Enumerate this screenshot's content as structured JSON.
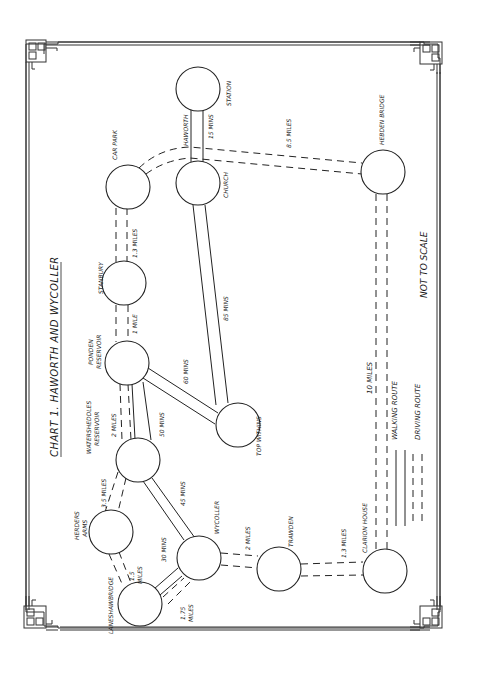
{
  "title": "CHART 1.  HAWORTH AND WYCOLLER",
  "note": "NOT TO SCALE",
  "legend": {
    "walking": "WALKING ROUTE",
    "driving": "DRIVING ROUTE"
  },
  "nodes": {
    "haworth_station": "STATION",
    "haworth": "HAWORTH",
    "church": "CHURCH",
    "car_park": "CAR PARK",
    "stanbury": "STANBURY",
    "ponden_1": "PONDEN",
    "ponden_2": "RESERVOIR",
    "watersheddles_1": "WATERSHEDDLES",
    "watersheddles_2": "RESERVOIR",
    "herders_1": "HERDERS",
    "herders_2": "ARMS",
    "laneshawbridge": "LANESHAWBRIDGE",
    "wycoller": "WYCOLLER",
    "top_withins": "TOP WITHINS",
    "trawden": "TRAWDEN",
    "clarion_house": "CLARION HOUSE",
    "hebden_bridge": "HEBDEN BRIDGE"
  },
  "edges": {
    "station_church": "15 MINS",
    "church_hebden": "8.5 MILES",
    "carpark_stanbury": "1.3 MILES",
    "stanbury_ponden": "1 MILE",
    "church_topwithins": "85 MINS",
    "ponden_topwithins": "60 MINS",
    "ponden_watersheddles_walk": "2 MILES",
    "ponden_watersheddles_drive": "50 MINS",
    "watersheddles_herders": "3.5 MILES",
    "watersheddles_wycoller": "45 MINS",
    "herders_laneshaw_1": "1.5",
    "herders_laneshaw_2": "MILES",
    "laneshaw_wycoller_drive": "30 MINS",
    "laneshaw_wycoller_walk_1": "1.75",
    "laneshaw_wycoller_walk_2": "MILES",
    "wycoller_trawden": "2 MILES",
    "trawden_clarion": "1.3 MILES",
    "clarion_hebden": "10 MILES"
  },
  "diagram_data": {
    "type": "route-network",
    "nodes": [
      "Haworth Station",
      "Haworth Church",
      "Car Park",
      "Stanbury",
      "Ponden Reservoir",
      "Watersheddles Reservoir",
      "Herders Arms",
      "Laneshawbridge",
      "Wycoller",
      "Top Withins",
      "Trawden",
      "Clarion House",
      "Hebden Bridge"
    ],
    "edges": [
      {
        "from": "Haworth Station",
        "to": "Church",
        "type": "driving",
        "label": "15 MINS"
      },
      {
        "from": "Car Park",
        "to": "Hebden Bridge",
        "type": "walking",
        "label": "8.5 MILES"
      },
      {
        "from": "Car Park",
        "to": "Stanbury",
        "type": "walking",
        "label": "1.3 MILES"
      },
      {
        "from": "Stanbury",
        "to": "Ponden Reservoir",
        "type": "walking",
        "label": "1 MILE"
      },
      {
        "from": "Church",
        "to": "Top Withins",
        "type": "driving",
        "label": "85 MINS"
      },
      {
        "from": "Ponden Reservoir",
        "to": "Top Withins",
        "type": "driving",
        "label": "60 MINS"
      },
      {
        "from": "Ponden Reservoir",
        "to": "Watersheddles Reservoir",
        "type": "walking",
        "label": "2 MILES"
      },
      {
        "from": "Ponden Reservoir",
        "to": "Watersheddles Reservoir",
        "type": "driving",
        "label": "50 MINS"
      },
      {
        "from": "Watersheddles Reservoir",
        "to": "Herders Arms",
        "type": "walking",
        "label": "3.5 MILES"
      },
      {
        "from": "Watersheddles Reservoir",
        "to": "Wycoller",
        "type": "driving",
        "label": "45 MINS"
      },
      {
        "from": "Herders Arms",
        "to": "Laneshawbridge",
        "type": "walking",
        "label": "1.5 MILES"
      },
      {
        "from": "Laneshawbridge",
        "to": "Wycoller",
        "type": "driving",
        "label": "30 MINS"
      },
      {
        "from": "Laneshawbridge",
        "to": "Wycoller",
        "type": "walking",
        "label": "1.75 MILES"
      },
      {
        "from": "Wycoller",
        "to": "Trawden",
        "type": "walking",
        "label": "2 MILES"
      },
      {
        "from": "Trawden",
        "to": "Clarion House",
        "type": "walking",
        "label": "1.3 MILES"
      },
      {
        "from": "Clarion House",
        "to": "Hebden Bridge",
        "type": "walking",
        "label": "10 MILES"
      }
    ]
  }
}
